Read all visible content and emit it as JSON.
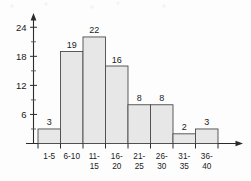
{
  "chart_data": {
    "type": "bar",
    "title": "",
    "subtitle": "",
    "xlabel": "",
    "ylabel": "",
    "categories": [
      "1-5",
      "6-10",
      "11-15",
      "16-20",
      "21-25",
      "26-30",
      "31-35",
      "36-40"
    ],
    "values": [
      3,
      19,
      22,
      16,
      8,
      8,
      2,
      3
    ],
    "data_labels": [
      "3",
      "19",
      "22",
      "16",
      "8",
      "8",
      "2",
      "3"
    ],
    "category_lines": [
      [
        "1-5"
      ],
      [
        "6-10"
      ],
      [
        "11-",
        "15"
      ],
      [
        "16-",
        "20"
      ],
      [
        "21-",
        "25"
      ],
      [
        "26-",
        "30"
      ],
      [
        "31-",
        "35"
      ],
      [
        "36-",
        "40"
      ]
    ],
    "ylim": [
      0,
      25.5
    ],
    "y_major_ticks": [
      6,
      12,
      18,
      24
    ],
    "y_major_tick_labels": [
      "6",
      "12",
      "18",
      "24"
    ],
    "y_minor_ticks": [
      3,
      9,
      15,
      21
    ],
    "grid": false,
    "legend": false,
    "legend_position": "none",
    "axis_style": "arrow",
    "colors": {
      "bar_fill": "#e7e7e7",
      "bar_stroke": "#4a4a4a",
      "axis": "#2b2b2b",
      "text": "#1a1a1a",
      "background": "#fdfdfd"
    }
  }
}
